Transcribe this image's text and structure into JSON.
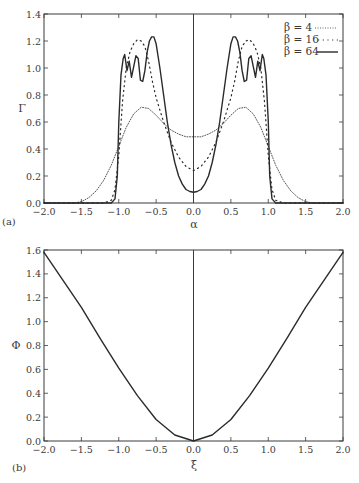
{
  "chart_data": [
    {
      "panel": "(a)",
      "type": "line",
      "title": "",
      "xlabel": "α",
      "ylabel": "Γ",
      "xlim": [
        -2.0,
        2.0
      ],
      "ylim": [
        0.0,
        1.4
      ],
      "xticks": [
        "-2.0",
        "-1.5",
        "-1.0",
        "-0.5",
        "0.0",
        "0.5",
        "1.0",
        "1.5",
        "2.0"
      ],
      "yticks": [
        "0.0",
        "0.2",
        "0.4",
        "0.6",
        "0.8",
        "1.0",
        "1.2",
        "1.4"
      ],
      "grid": false,
      "legend_position": "upper right",
      "vertical_line_at": 0.0,
      "series": [
        {
          "name": "β = 4",
          "style": "dotted-fine",
          "x": [
            -2.0,
            -1.6,
            -1.5,
            -1.4,
            -1.3,
            -1.2,
            -1.1,
            -1.0,
            -0.9,
            -0.8,
            -0.7,
            -0.6,
            -0.5,
            -0.4,
            -0.3,
            -0.2,
            -0.1,
            0.0,
            0.1,
            0.2,
            0.3,
            0.4,
            0.5,
            0.6,
            0.7,
            0.8,
            0.9,
            1.0,
            1.1,
            1.2,
            1.3,
            1.4,
            1.5,
            1.6,
            2.0
          ],
          "y": [
            0.0,
            0.0,
            0.01,
            0.04,
            0.09,
            0.17,
            0.28,
            0.42,
            0.56,
            0.66,
            0.71,
            0.7,
            0.65,
            0.59,
            0.54,
            0.51,
            0.49,
            0.49,
            0.49,
            0.51,
            0.54,
            0.59,
            0.65,
            0.7,
            0.71,
            0.66,
            0.56,
            0.42,
            0.28,
            0.17,
            0.09,
            0.04,
            0.01,
            0.0,
            0.0
          ]
        },
        {
          "name": "β = 16",
          "style": "dotted-coarse",
          "x": [
            -2.0,
            -1.2,
            -1.1,
            -1.05,
            -1.0,
            -0.95,
            -0.9,
            -0.85,
            -0.8,
            -0.75,
            -0.7,
            -0.65,
            -0.6,
            -0.55,
            -0.5,
            -0.4,
            -0.3,
            -0.2,
            -0.1,
            0.0,
            0.1,
            0.2,
            0.3,
            0.4,
            0.5,
            0.55,
            0.6,
            0.65,
            0.7,
            0.75,
            0.8,
            0.85,
            0.9,
            0.95,
            1.0,
            1.05,
            1.1,
            1.2,
            2.0
          ],
          "y": [
            0.0,
            0.0,
            0.02,
            0.1,
            0.35,
            0.75,
            1.0,
            1.12,
            1.18,
            1.21,
            1.2,
            1.16,
            1.05,
            0.9,
            0.78,
            0.6,
            0.45,
            0.34,
            0.27,
            0.24,
            0.27,
            0.34,
            0.45,
            0.6,
            0.78,
            0.9,
            1.05,
            1.16,
            1.2,
            1.21,
            1.18,
            1.12,
            1.0,
            0.75,
            0.35,
            0.1,
            0.02,
            0.0,
            0.0
          ]
        },
        {
          "name": "β = 64",
          "style": "solid",
          "x": [
            -2.0,
            -1.1,
            -1.05,
            -1.02,
            -1.0,
            -0.97,
            -0.94,
            -0.92,
            -0.89,
            -0.86,
            -0.83,
            -0.8,
            -0.77,
            -0.74,
            -0.71,
            -0.68,
            -0.65,
            -0.62,
            -0.59,
            -0.56,
            -0.53,
            -0.5,
            -0.45,
            -0.4,
            -0.35,
            -0.3,
            -0.25,
            -0.2,
            -0.15,
            -0.1,
            -0.05,
            0.0,
            0.05,
            0.1,
            0.15,
            0.2,
            0.25,
            0.3,
            0.35,
            0.4,
            0.45,
            0.5,
            0.53,
            0.56,
            0.59,
            0.62,
            0.65,
            0.68,
            0.71,
            0.74,
            0.77,
            0.8,
            0.83,
            0.86,
            0.89,
            0.92,
            0.94,
            0.97,
            1.0,
            1.02,
            1.05,
            1.1,
            2.0
          ],
          "y": [
            0.0,
            0.0,
            0.03,
            0.2,
            0.6,
            0.95,
            1.07,
            1.1,
            0.98,
            1.05,
            0.93,
            1.01,
            1.09,
            1.07,
            0.91,
            0.9,
            0.98,
            1.12,
            1.2,
            1.23,
            1.23,
            1.18,
            1.0,
            0.8,
            0.6,
            0.43,
            0.3,
            0.2,
            0.14,
            0.1,
            0.085,
            0.08,
            0.085,
            0.1,
            0.14,
            0.2,
            0.3,
            0.43,
            0.6,
            0.8,
            1.0,
            1.18,
            1.23,
            1.23,
            1.2,
            1.12,
            0.98,
            0.9,
            0.91,
            1.07,
            1.09,
            1.01,
            0.93,
            1.05,
            0.98,
            1.1,
            1.07,
            0.95,
            0.6,
            0.2,
            0.03,
            0.0,
            0.0
          ]
        }
      ]
    },
    {
      "panel": "(b)",
      "type": "line",
      "title": "",
      "xlabel": "ξ",
      "ylabel": "Φ",
      "xlim": [
        -2.0,
        2.0
      ],
      "ylim": [
        0.0,
        1.6
      ],
      "xticks": [
        "-2.0",
        "-1.5",
        "-1.0",
        "-0.5",
        "0.0",
        "0.5",
        "1.0",
        "1.5",
        "2.0"
      ],
      "yticks": [
        "0.0",
        "0.2",
        "0.4",
        "0.6",
        "0.8",
        "1.0",
        "1.2",
        "1.4",
        "1.6"
      ],
      "grid": false,
      "vertical_line_at": 0.0,
      "series": [
        {
          "name": "Φ(ξ)",
          "style": "solid",
          "x": [
            -2.0,
            -1.75,
            -1.5,
            -1.25,
            -1.0,
            -0.75,
            -0.5,
            -0.25,
            0.0,
            0.25,
            0.5,
            0.75,
            1.0,
            1.25,
            1.5,
            1.75,
            2.0
          ],
          "y": [
            1.58,
            1.35,
            1.12,
            0.86,
            0.61,
            0.38,
            0.18,
            0.05,
            0.0,
            0.05,
            0.18,
            0.38,
            0.61,
            0.86,
            1.12,
            1.35,
            1.58
          ]
        }
      ]
    }
  ],
  "panels": {
    "a": {
      "label": "(a)",
      "xlabel": "α",
      "ylabel": "Γ",
      "legend": [
        {
          "text": "β = 4"
        },
        {
          "text": "β = 16"
        },
        {
          "text": "β = 64"
        }
      ]
    },
    "b": {
      "label": "(b)",
      "xlabel": "ξ",
      "ylabel": "Φ"
    }
  },
  "colors": {
    "line": "#2a2a2a",
    "axis": "#3a3a3a",
    "background": "#ffffff"
  }
}
